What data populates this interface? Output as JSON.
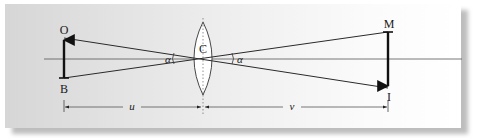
{
  "diagram": {
    "type": "thin lens ray diagram (angular magnification / pinhole-lens similar triangles)",
    "labels": {
      "object_top": "O",
      "object_bottom": "B",
      "lens_center": "C",
      "image_top": "M",
      "image_bottom": "I",
      "angle_left": "α",
      "angle_right": "α",
      "object_distance": "u",
      "image_distance": "v"
    },
    "colors": {
      "line": "#2a2a2a",
      "axis": "#555555",
      "lens_fill": "#ffffff",
      "panel_left": "#d6d6d6",
      "panel_right": "#ffffff"
    }
  }
}
